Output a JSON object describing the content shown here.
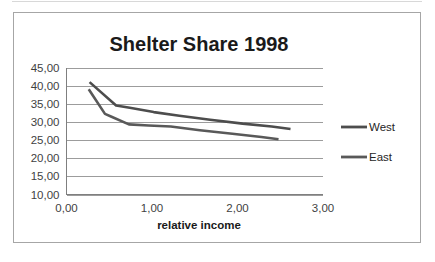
{
  "chart_data": {
    "type": "line",
    "title": "Shelter Share 1998",
    "xlabel": "relative income",
    "ylabel": "",
    "xlim": [
      0,
      3
    ],
    "ylim": [
      10,
      45
    ],
    "x_ticks": [
      0,
      1,
      2,
      3
    ],
    "x_tick_labels": [
      "0,00",
      "1,00",
      "2,00",
      "3,00"
    ],
    "y_ticks": [
      10,
      15,
      20,
      25,
      30,
      35,
      40,
      45
    ],
    "y_tick_labels": [
      "10,00",
      "15,00",
      "20,00",
      "25,00",
      "30,00",
      "35,00",
      "40,00",
      "45,00"
    ],
    "grid": true,
    "legend_position": "right",
    "series": [
      {
        "name": "West",
        "color": "#4d4d4d",
        "points": [
          {
            "x": 0.27,
            "y": 41.1
          },
          {
            "x": 0.58,
            "y": 34.6
          },
          {
            "x": 0.74,
            "y": 34.0
          },
          {
            "x": 1.02,
            "y": 32.8
          },
          {
            "x": 1.32,
            "y": 31.8
          },
          {
            "x": 1.68,
            "y": 30.7
          },
          {
            "x": 2.06,
            "y": 29.6
          },
          {
            "x": 2.4,
            "y": 28.8
          },
          {
            "x": 2.62,
            "y": 28.1
          }
        ]
      },
      {
        "name": "East",
        "color": "#595959",
        "points": [
          {
            "x": 0.26,
            "y": 39.1
          },
          {
            "x": 0.45,
            "y": 32.3
          },
          {
            "x": 0.52,
            "y": 31.6
          },
          {
            "x": 0.73,
            "y": 29.4
          },
          {
            "x": 0.96,
            "y": 29.1
          },
          {
            "x": 1.22,
            "y": 28.8
          },
          {
            "x": 1.56,
            "y": 27.8
          },
          {
            "x": 1.94,
            "y": 26.8
          },
          {
            "x": 2.28,
            "y": 25.9
          },
          {
            "x": 2.48,
            "y": 25.3
          }
        ]
      }
    ]
  },
  "legend": {
    "entries": [
      {
        "label": "West"
      },
      {
        "label": "East"
      }
    ]
  }
}
